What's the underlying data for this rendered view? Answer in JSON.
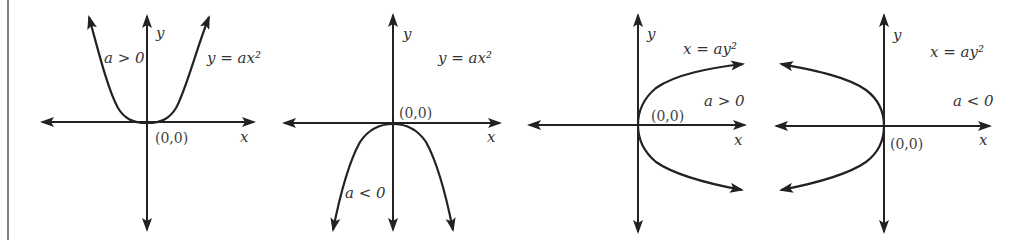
{
  "figure": {
    "panels": [
      {
        "id": "upward",
        "equation": "y = ax²",
        "condition": "a > 0",
        "origin_label": "(0,0)",
        "x_axis_label": "x",
        "y_axis_label": "y",
        "opens": "up"
      },
      {
        "id": "downward",
        "equation": "y = ax²",
        "condition": "a < 0",
        "origin_label": "(0,0)",
        "x_axis_label": "x",
        "y_axis_label": "y",
        "opens": "down"
      },
      {
        "id": "rightward",
        "equation": "x = ay²",
        "condition": "a > 0",
        "origin_label": "(0,0)",
        "x_axis_label": "x",
        "y_axis_label": "y",
        "opens": "right"
      },
      {
        "id": "leftward",
        "equation": "x = ay²",
        "condition": "a < 0",
        "origin_label": "(0,0)",
        "x_axis_label": "x",
        "y_axis_label": "y",
        "opens": "left"
      }
    ]
  },
  "colors": {
    "ink": "#222222",
    "text": "#333333",
    "background": "#ffffff"
  }
}
